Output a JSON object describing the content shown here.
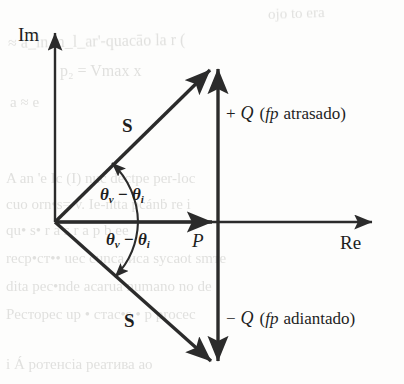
{
  "figure": {
    "kind": "complex-power-phasor-diagram",
    "background_color": "#fdfdfc",
    "ink_color": "#2b2b2b"
  },
  "axes": {
    "imaginary_label": "Im",
    "real_label": "Re",
    "origin": {
      "x": 53,
      "y": 222
    },
    "im_axis_top_y": 28,
    "re_axis_right_x": 377
  },
  "labels": {
    "vector_s_upper": "S",
    "vector_s_lower": "S",
    "real_power": "P",
    "angle_upper": {
      "theta": "θ",
      "sub_v": "v",
      "minus": "−",
      "sub_i": "i"
    },
    "angle_lower": {
      "theta": "θ",
      "sub_v": "v",
      "minus": "−",
      "sub_i": "i"
    }
  },
  "quadrature": {
    "positive": {
      "sign": "+",
      "symbol": "Q",
      "paren_open": "(",
      "pf": "fp",
      "condition": "atrasado",
      "paren_close": ")"
    },
    "negative": {
      "sign": "−",
      "symbol": "Q",
      "paren_open": "(",
      "pf": "fp",
      "condition": "adiantado",
      "paren_close": ")"
    }
  },
  "chart_data": {
    "type": "scatter",
    "title": "",
    "xlabel": "Re",
    "ylabel": "Im",
    "grid": false,
    "legend": "none",
    "annotations": [
      "S",
      "S",
      "P",
      "+ Q (fp atrasado)",
      "− Q (fp adiantado)",
      "θv − θi",
      "θv − θi"
    ],
    "series": [
      {
        "name": "S (lagging power factor)",
        "type": "vector",
        "from": [
          0,
          0
        ],
        "to": [
          165,
          160
        ],
        "label": "S"
      },
      {
        "name": "S (leading power factor)",
        "type": "vector",
        "from": [
          0,
          0
        ],
        "to": [
          163,
          -146
        ],
        "label": "S"
      },
      {
        "name": "P (real power)",
        "type": "vector",
        "from": [
          0,
          0
        ],
        "to": [
          163,
          0
        ],
        "label": "P"
      },
      {
        "name": "+Q (reactive power, lagging)",
        "type": "vector",
        "from": [
          165,
          0
        ],
        "to": [
          165,
          160
        ],
        "label": "+ Q (fp atrasado)"
      },
      {
        "name": "-Q (reactive power, leading)",
        "type": "vector",
        "from": [
          165,
          0
        ],
        "to": [
          165,
          -146
        ],
        "label": "− Q (fp adiantado)"
      }
    ],
    "angles": [
      {
        "name": "theta_v - theta_i (upper)",
        "from_deg": 0,
        "to_deg": 44,
        "label": "θv − θi"
      },
      {
        "name": "theta_v - theta_i (lower)",
        "from_deg": 0,
        "to_deg": -42,
        "label": "θv − θi"
      }
    ]
  },
  "bleed_through": [
    {
      "text": "ojo to era",
      "x": 268,
      "y": 6,
      "size": 15,
      "rot": -2
    },
    {
      "text": "≈  a_ln m_l_ar'-quacāo  la r (",
      "x": 8,
      "y": 34,
      "size": 16,
      "rot": -1
    },
    {
      "text": "p₂ =  Vmax x",
      "x": 60,
      "y": 62,
      "size": 16,
      "rot": 0
    },
    {
      "text": "a  ≈  e",
      "x": 10,
      "y": 94,
      "size": 15,
      "rot": 0
    },
    {
      "text": "A  an      'e  Iс (I) nuс deсtре per-loс",
      "x": 6,
      "y": 170,
      "size": 15,
      "rot": 0
    },
    {
      "text": "cuo  orn•s=  v. Ie-ntta pcánḃ re i",
      "x": 6,
      "y": 196,
      "size": 15,
      "rot": 0
    },
    {
      "text": "qu•    s•  r  a     s  r  а    р   b  еe",
      "x": 6,
      "y": 222,
      "size": 15,
      "rot": 0
    },
    {
      "text": "reср•ст••   ueс cunса иса sусаot smтe",
      "x": 6,
      "y": 250,
      "size": 15,
      "rot": 0
    },
    {
      "text": "dita рeс•nde аcаruа numаno no dе",
      "x": 6,
      "y": 278,
      "size": 15,
      "rot": 0
    },
    {
      "text": "Рeсторeс  uр • стас•s • р рroсeс",
      "x": 6,
      "y": 306,
      "size": 15,
      "rot": 0
    },
    {
      "text": "i      Á  рoтенсіа реатива ао",
      "x": 6,
      "y": 356,
      "size": 15,
      "rot": 0
    }
  ]
}
